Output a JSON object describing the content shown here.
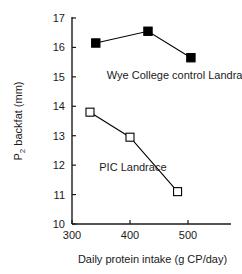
{
  "chart_data": {
    "type": "line",
    "title": "",
    "xlabel": "Daily protein intake (g CP/day)",
    "ylabel": "P2 backfat (mm)",
    "ylabel_main": "P",
    "ylabel_sub": "2",
    "ylabel_rest": " backfat (mm)",
    "xlim": [
      290,
      530
    ],
    "ylim": [
      10,
      17
    ],
    "xticks": [
      300,
      400,
      500
    ],
    "xtick_labels": [
      "300",
      "400",
      "500"
    ],
    "yticks": [
      10,
      11,
      12,
      13,
      14,
      15,
      16,
      17
    ],
    "ytick_labels": [
      "10",
      "11",
      "12",
      "13",
      "14",
      "15",
      "16",
      "17"
    ],
    "grid": false,
    "legend_position": "inline-annotation",
    "series": [
      {
        "name": "Wye College control Landrace",
        "marker": "filled-square",
        "color": "#000000",
        "x": [
          341,
          431,
          505
        ],
        "y": [
          16.15,
          16.55,
          15.65
        ],
        "label_x": 360,
        "label_y": 15.05
      },
      {
        "name": "PIC Landrace",
        "marker": "open-square",
        "color": "#000000",
        "x": [
          331,
          400,
          482
        ],
        "y": [
          13.8,
          12.95,
          11.1
        ],
        "label_x": 347,
        "label_y": 11.95
      }
    ],
    "annotations": [
      {
        "text": "Wye College control Landrace",
        "series": 0
      },
      {
        "text": "PIC Landrace",
        "series": 1
      }
    ]
  }
}
